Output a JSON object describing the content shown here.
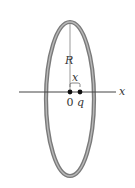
{
  "diagram": {
    "type": "ring-with-point-charge-on-axis",
    "labels": {
      "radius": "R",
      "distance": "x",
      "origin": "0",
      "charge": "q",
      "axis": "x"
    },
    "colors": {
      "ring": "#8a8a8a",
      "ring_highlight": "#b5b5b5",
      "line": "#444444",
      "dot": "#111111",
      "text": "#333333"
    }
  }
}
